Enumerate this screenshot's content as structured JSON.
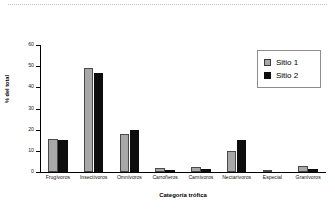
{
  "figure": {
    "background_color": "#ffffff",
    "top_rule_present": true
  },
  "legend": {
    "position": "top-right",
    "entries": [
      {
        "label": "Sitio 1",
        "color": "#a8a8a8",
        "swatch_name": "legend-swatch-sitio-1"
      },
      {
        "label": "Sitio 2",
        "color": "#0d0d0d",
        "swatch_name": "legend-swatch-sitio-2"
      }
    ]
  },
  "axes": {
    "y_title": "% del total",
    "x_title": "Categoría trófica",
    "y_ticks": [
      "60",
      "50",
      "40",
      "30",
      "20",
      "10",
      "0"
    ],
    "y_min": 0,
    "y_max": 60
  },
  "chart_data": {
    "type": "bar",
    "title": "",
    "subtitle": "",
    "xlabel": "Categoría trófica",
    "ylabel": "% del total",
    "ylim": [
      0,
      60
    ],
    "ytick_values": [
      0,
      10,
      20,
      30,
      40,
      50,
      60
    ],
    "grid": false,
    "legend_position": "top-right",
    "categories": [
      "Frugívoros",
      "Insectívoros",
      "Omnívoros",
      "Carroñeros",
      "Carnívoros",
      "Nectarívoros",
      "Especial",
      "Granívoros"
    ],
    "series": [
      {
        "name": "Sitio 1",
        "color": "#a8a8a8",
        "values": [
          15.5,
          49,
          18,
          1.8,
          2.5,
          10,
          0.6,
          3
        ]
      },
      {
        "name": "Sitio 2",
        "color": "#0d0d0d",
        "values": [
          15.3,
          47,
          19.8,
          0.9,
          1.5,
          15,
          0,
          1.6
        ]
      }
    ]
  }
}
